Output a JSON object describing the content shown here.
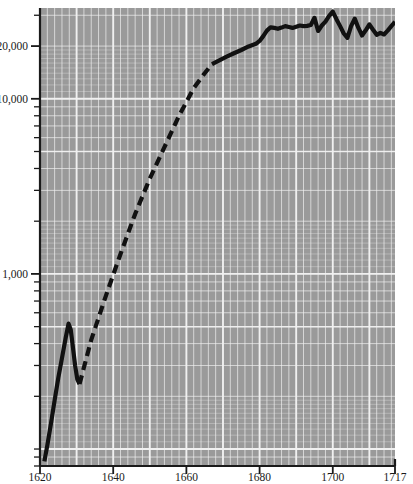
{
  "chart_data": {
    "type": "line",
    "title": "",
    "subtitle": "",
    "xlabel": "",
    "ylabel": "",
    "yscale": "log",
    "xlim": [
      1620,
      1717
    ],
    "ylim": [
      80,
      33000
    ],
    "grid": true,
    "legend": null,
    "legend_position": "none",
    "y_tick_labels": [
      "20,000",
      "10,000",
      "1,000"
    ],
    "y_tick_values": [
      20000,
      10000,
      1000
    ],
    "x_tick_labels": [
      "1620",
      "1640",
      "1660",
      "1680",
      "1700",
      "1717"
    ],
    "x_tick_values": [
      1620,
      1640,
      1660,
      1680,
      1700,
      1717
    ],
    "line_color": "#111111",
    "line_width": 4.2,
    "background_color": "#9a9a9a",
    "gridline_color": "#f2f2f2",
    "axis_color": "#1a1a1a",
    "series": [
      {
        "name": "observed-early",
        "style": "solid",
        "x": [
          1621.2,
          1622,
          1623,
          1624,
          1625,
          1626,
          1627,
          1627.8,
          1628.4,
          1629,
          1629.6,
          1630.2,
          1630.8
        ],
        "values": [
          85,
          105,
          140,
          190,
          255,
          330,
          430,
          520,
          480,
          380,
          300,
          250,
          235
        ]
      },
      {
        "name": "interpolated",
        "style": "dashed",
        "x": [
          1630.8,
          1634,
          1638,
          1642,
          1646,
          1650,
          1654,
          1658,
          1662,
          1665,
          1667
        ],
        "values": [
          235,
          420,
          750,
          1300,
          2200,
          3500,
          5300,
          8000,
          11500,
          14000,
          15800
        ]
      },
      {
        "name": "observed-late",
        "style": "solid",
        "x": [
          1667,
          1669,
          1671,
          1673,
          1675,
          1677,
          1679,
          1680,
          1681,
          1682,
          1683,
          1684,
          1685,
          1686,
          1687,
          1688,
          1689,
          1690,
          1691,
          1692,
          1693,
          1694,
          1695,
          1696,
          1697,
          1698,
          1699,
          1700,
          1701,
          1702,
          1703,
          1704,
          1705,
          1706,
          1707,
          1708,
          1709,
          1710,
          1711,
          1712,
          1713,
          1714,
          1715,
          1716,
          1717
        ],
        "values": [
          15800,
          16600,
          17400,
          18200,
          19000,
          19900,
          20600,
          21400,
          22800,
          24500,
          25600,
          25400,
          25100,
          25500,
          26000,
          25700,
          25400,
          25800,
          26200,
          26000,
          26100,
          26400,
          29000,
          24400,
          26200,
          27600,
          29800,
          31500,
          28500,
          26000,
          23600,
          22300,
          26000,
          28700,
          25400,
          23000,
          24600,
          26600,
          24800,
          23200,
          23800,
          23300,
          24500,
          26000,
          27500
        ]
      }
    ]
  },
  "axes": {
    "y_axis_name": "y-axis",
    "x_axis_name": "x-axis"
  }
}
